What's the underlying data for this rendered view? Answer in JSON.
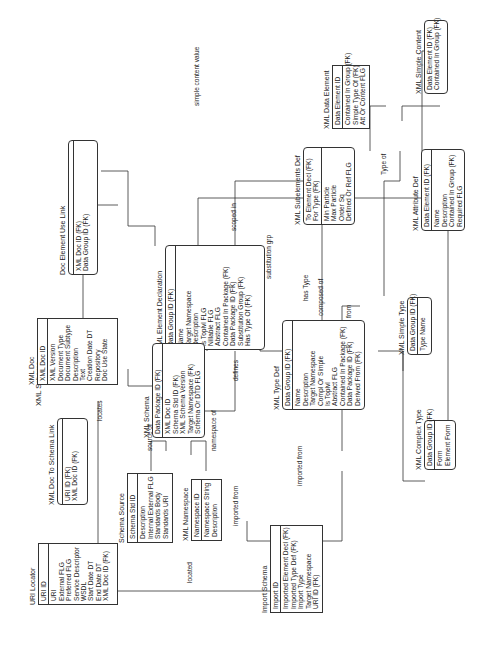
{
  "diagram_title": "XML Schema",
  "entities": {
    "xml_doc": {
      "name": "XML Doc",
      "pk": [
        "XML Doc ID"
      ],
      "attrs": [
        "XML Version",
        "Document Type",
        "Document Subtype",
        "Description",
        "Text",
        "Creation Date DT",
        "Repository",
        "Doc Use State"
      ]
    },
    "doc_element_use_link": {
      "name": "Doc Element Use Link",
      "pk": [],
      "attrs": [
        "XML Doc ID (FK)",
        "Data Group ID (FK)"
      ]
    },
    "xml_element_declaration": {
      "name": "XML Element Declaration",
      "pk": [
        "Data Group ID (FK)"
      ],
      "attrs": [
        "Name",
        "Target Namespace",
        "Description",
        "Is Toplvl FLG",
        "Nillable FLG",
        "Abstract FLG",
        "Contained In Package (FK)",
        "Data Package ID (FK)",
        "Substitution Group (FK)",
        "Has Type Of (FK)"
      ]
    },
    "xml_schema": {
      "name": "XML Schema",
      "pk": [
        "Data Package ID (FK)"
      ],
      "attrs": [
        "XML Doc ID",
        "Schema Std ID (FK)",
        "XML Schema Version",
        "Target Namespace (FK)",
        "Schema Or DTD FLG"
      ]
    },
    "xml_doc_to_schema_link": {
      "name": "XML Doc To Schema Link",
      "pk": [],
      "attrs": [
        "URI ID (FK)",
        "XML Doc ID (FK)"
      ]
    },
    "uri_locator": {
      "name": "URI Locator",
      "pk": [
        "URI ID"
      ],
      "attrs": [
        "URI",
        "External FLG",
        "Preferred FLG",
        "Service Descriptor",
        "WSDL",
        "Start Date DT",
        "End Date DT",
        "XML Doc ID (FK)"
      ]
    },
    "schema_source": {
      "name": "Schema Source",
      "pk": [
        "Schema Std ID"
      ],
      "attrs": [
        "Description",
        "Internal External FLG",
        "Standards Body",
        "Standards URI"
      ]
    },
    "xml_namespace": {
      "name": "XML Namespace",
      "pk": [
        "Namespace ID"
      ],
      "attrs": [
        "Namespace String",
        "Description"
      ]
    },
    "import_schema": {
      "name": "Import Schema",
      "pk": [
        "Import ID"
      ],
      "attrs": [
        "Imported Element Decl (FK)",
        "Imported Type Def (FK)",
        "Import Type",
        "Target Namespace",
        "URI ID (FK)"
      ]
    },
    "xml_type_def": {
      "name": "XML Type Def",
      "pk": [
        "Data Group ID (FK)"
      ],
      "attrs": [
        "Name",
        "Description",
        "Target Namespace",
        "Compl Or Simple",
        "Is Toplvl",
        "Abstract FLG",
        "Contained In Package (FK)",
        "Data Package ID (FK)",
        "Derived From (FK)"
      ]
    },
    "xml_simple_type": {
      "name": "XML Simple Type",
      "pk": [
        "Data Group ID (FK)"
      ],
      "attrs": [
        "Type Name"
      ]
    },
    "xml_complex_type": {
      "name": "XML Complex Type",
      "pk": [
        "Data Group ID (FK)"
      ],
      "attrs": [
        "Form",
        "Element Form"
      ]
    },
    "xml_attribute_def": {
      "name": "XML Attribute Def",
      "pk": [
        "Data Element ID (FK)"
      ],
      "attrs": [
        "Name",
        "Description",
        "Contained In Group (FK)",
        "Required FLG"
      ]
    },
    "xml_subelements_def": {
      "name": "XML Subelements Def",
      "pk": [
        "To Element Decl (FK)",
        "For Type (FK)"
      ],
      "attrs": [
        "Min Particle",
        "Max Particle",
        "Order Sq",
        "Defined Or Ref FLG"
      ]
    },
    "xml_data_element": {
      "name": "XML Data Element",
      "pk": [
        "Data Element ID"
      ],
      "attrs": [
        "Contained In Group (FK)",
        "Simple Type Of (FK)",
        "Att Or Content FLG"
      ]
    },
    "xml_simple_content": {
      "name": "XML Simple Content",
      "pk": [],
      "attrs": [
        "Data Element ID (FK)",
        "Contained In Group (FK)"
      ]
    }
  },
  "relationships": {
    "simple_content_value": "simple content value",
    "scoped_in": "scoped in",
    "substitution_grp": "substitution grp",
    "has_type": "has Type",
    "composed_of": "composed of",
    "derived_from": "derived from",
    "type_of": "Type of",
    "defines_attr": "defines",
    "defines_schema_elem": "defines",
    "defines_schema_type": "defines",
    "locates": "locates",
    "source_of": "source of",
    "namespace_of": "namespace of",
    "imported_from_left": "imported from",
    "imported_from_right": "imported from",
    "located": "located"
  }
}
